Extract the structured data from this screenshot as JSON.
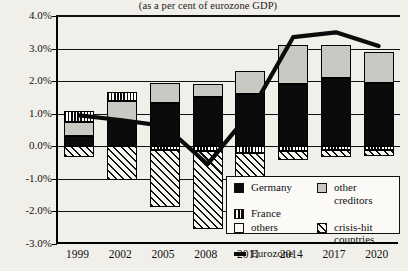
{
  "chart_data": {
    "type": "bar",
    "title": "(as a per cent of eurozone GDP)",
    "xlabel": "",
    "ylabel": "",
    "ylim": [
      -3.0,
      4.0
    ],
    "ytick_values": [
      4.0,
      3.0,
      2.0,
      1.0,
      0.0,
      -1.0,
      -2.0,
      -3.0
    ],
    "ytick_labels": [
      "4.0%",
      "3.0%",
      "2.0%",
      "1.0%",
      "0.0%",
      "-1.0%",
      "-2.0%",
      "-3.0%"
    ],
    "categories": [
      "1999",
      "2002",
      "2005",
      "2008",
      "2011",
      "2014",
      "2017",
      "2020"
    ],
    "stacked": true,
    "grid": true,
    "legend_position": "inside-bottom-right",
    "series": [
      {
        "name": "Germany",
        "style": "solid-black",
        "color": "#0b0b0b",
        "values": [
          0.32,
          0.78,
          1.32,
          1.52,
          1.62,
          1.92,
          2.1,
          1.95
        ]
      },
      {
        "name": "other creditors",
        "style": "light-grey",
        "color": "#c9c9c4",
        "values": [
          0.43,
          0.6,
          0.62,
          0.38,
          0.68,
          1.18,
          1.02,
          0.95
        ]
      },
      {
        "name": "France",
        "style": "vertical-stripes",
        "color": "#0b0b0b",
        "values": [
          0.34,
          0.28,
          -0.12,
          -0.16,
          -0.2,
          -0.14,
          -0.1,
          -0.1
        ]
      },
      {
        "name": "crisis-hit countries",
        "style": "diagonal-hatch",
        "color": "#111111",
        "values": [
          -0.33,
          -1.05,
          -1.75,
          -2.38,
          -1.28,
          -0.28,
          -0.22,
          -0.2
        ]
      },
      {
        "name": "others",
        "style": "white",
        "color": "#fbfaf7",
        "values": [
          0.0,
          0.0,
          0.0,
          0.0,
          0.0,
          0.0,
          0.0,
          0.0
        ]
      }
    ],
    "line_series": {
      "name": "Eurozone",
      "style": "thick-black-line",
      "color": "#0b0b0b",
      "values": [
        0.95,
        0.8,
        0.62,
        -0.55,
        1.05,
        3.35,
        3.5,
        3.08
      ]
    }
  },
  "legend": {
    "items": [
      {
        "label": "Germany",
        "swatch": "germany-swatch"
      },
      {
        "label": "other creditors",
        "swatch": "other-creditors-swatch"
      },
      {
        "label": "France",
        "swatch": "france-swatch"
      },
      {
        "label": "others",
        "swatch": "others-swatch"
      },
      {
        "label": "crisis-hit countries",
        "swatch": "crisis-hit-swatch"
      },
      {
        "label": "Eurozone",
        "swatch": "eurozone-line-swatch"
      }
    ],
    "col1": [
      "Germany",
      "France",
      "others",
      "Eurozone"
    ],
    "col2": [
      "other creditors",
      "crisis-hit countries"
    ]
  }
}
